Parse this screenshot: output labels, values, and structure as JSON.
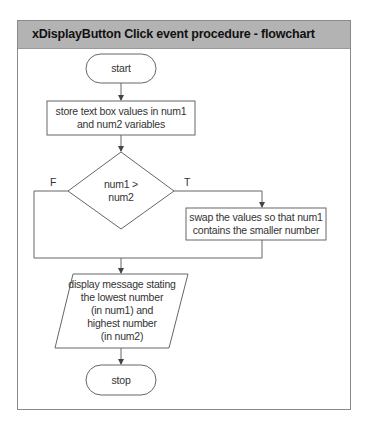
{
  "header": {
    "title": "xDisplayButton Click event procedure - flowchart"
  },
  "colors": {
    "header_bg": "#b3b3b3",
    "frame_border": "#8a8a8a",
    "line": "#555555",
    "text": "#333333"
  },
  "flowchart": {
    "start": "start",
    "store": "store text box values in num1 and num2 variables",
    "decision": "num1 > num2",
    "decision_line1": "num1 >",
    "decision_line2": "num2",
    "false_label": "F",
    "true_label": "T",
    "swap": "swap the values so that num1 contains the smaller number",
    "swap_line1": "swap the values so that num1",
    "swap_line2": "contains the smaller number",
    "display_lines": [
      "display message stating",
      "the lowest number",
      "(in num1) and",
      "highest number",
      "(in num2)"
    ],
    "stop": "stop"
  }
}
